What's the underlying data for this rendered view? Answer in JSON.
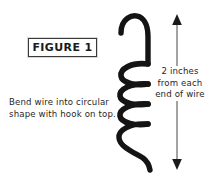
{
  "figure": {
    "caption_box_label": "FIGURE 1",
    "instruction_lines": [
      "Bend wire into circular",
      "shape with hook on top."
    ],
    "dimension_lines": [
      "2 inches",
      "from each",
      "end of wire"
    ],
    "colors": {
      "background": "#ffffff",
      "wire": "#141414",
      "text": "#1f1f1f",
      "box_border": "#3a3a3a",
      "arrow_shaft": "#8c8c8c",
      "arrow_head": "#1a1a1a"
    },
    "icons": {
      "wire": "coiled-wire-with-hook",
      "arrow": "double-headed-vertical-dimension-arrow"
    }
  }
}
